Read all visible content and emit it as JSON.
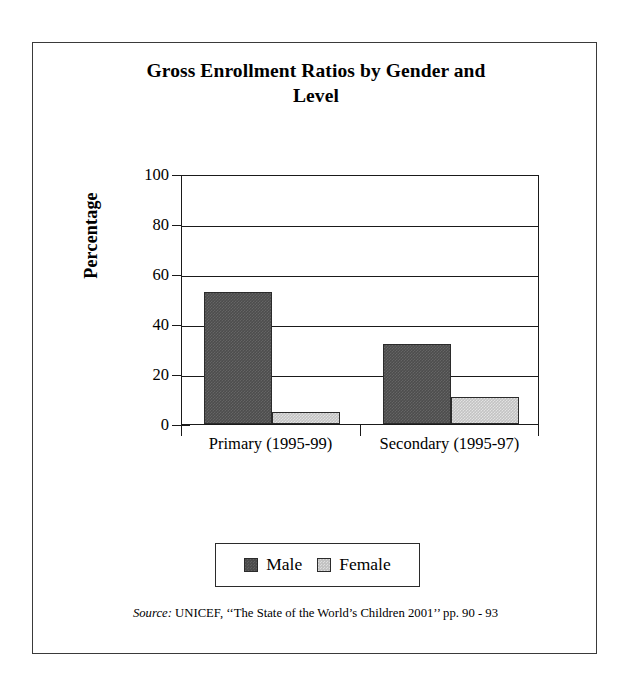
{
  "chart_data": {
    "type": "bar",
    "title": "Gross Enrollment Ratios by Gender and Level",
    "title_line1": "Gross Enrollment Ratios by Gender and",
    "title_line2": "Level",
    "xlabel": "",
    "ylabel": "Percentage",
    "categories": [
      "Primary (1995-99)",
      "Secondary (1995-97)"
    ],
    "series": [
      {
        "name": "Male",
        "color": "#4d4d4d",
        "values": [
          53,
          32
        ]
      },
      {
        "name": "Female",
        "color": "#c3c3c3",
        "values": [
          5,
          11
        ]
      }
    ],
    "ylim": [
      0,
      100
    ],
    "yticks": [
      100,
      80,
      60,
      40,
      20,
      0
    ],
    "ytick_labels": [
      "100",
      "80",
      "60",
      "40",
      "20",
      "0"
    ],
    "grid": true,
    "grid_axis": "y",
    "legend_position": "bottom-center",
    "legend_entries": [
      "Male",
      "Female"
    ]
  },
  "source": {
    "label": "Source:",
    "text": " UNICEF, ‘‘The State of the World’s Children 2001’’ pp. 90 - 93"
  }
}
